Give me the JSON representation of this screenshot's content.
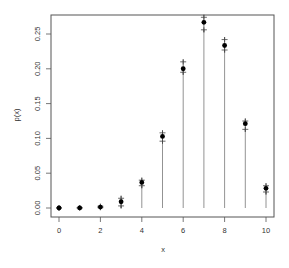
{
  "chart_data": {
    "type": "scatter",
    "title": "",
    "xlabel": "x",
    "ylabel": "p(x)",
    "xlim": [
      -0.4,
      10.4
    ],
    "ylim": [
      -0.011,
      0.278
    ],
    "x_ticks": [
      0,
      2,
      4,
      6,
      8,
      10
    ],
    "x_tick_labels": [
      "0",
      "2",
      "4",
      "6",
      "8",
      "10"
    ],
    "y_ticks": [
      0.0,
      0.05,
      0.1,
      0.15,
      0.2,
      0.25
    ],
    "y_tick_labels": [
      "0.00",
      "0.05",
      "0.10",
      "0.15",
      "0.20",
      "0.25"
    ],
    "grid": false,
    "legend": null,
    "x": [
      0,
      1,
      2,
      3,
      4,
      5,
      6,
      7,
      8,
      9,
      10
    ],
    "series": [
      {
        "name": "p(x) point estimate",
        "marker": "filled-circle",
        "values": [
          0.0,
          0.0001,
          0.0014,
          0.009,
          0.0368,
          0.1029,
          0.2001,
          0.2668,
          0.2335,
          0.1211,
          0.0282
        ]
      },
      {
        "name": "upper bound",
        "marker": "plus",
        "values": [
          0.0002,
          0.0004,
          0.0025,
          0.014,
          0.04,
          0.108,
          0.21,
          0.274,
          0.242,
          0.125,
          0.032
        ]
      },
      {
        "name": "lower bound",
        "marker": "plus",
        "stem": true,
        "values": [
          0.0,
          0.0,
          0.0005,
          0.003,
          0.032,
          0.096,
          0.195,
          0.256,
          0.227,
          0.113,
          0.023
        ]
      }
    ]
  },
  "colors": {
    "axis": "#555555",
    "point": "#000000",
    "stem": "#777777",
    "plus": "#444444",
    "background": "#ffffff"
  }
}
